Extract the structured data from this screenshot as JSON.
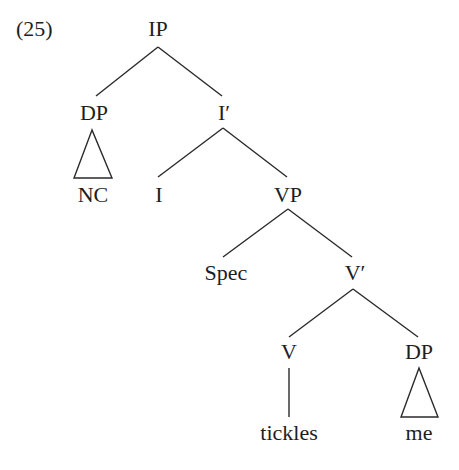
{
  "example_number": "(25)",
  "tree": {
    "nodes": {
      "ip": "IP",
      "dp_subject": "DP",
      "nc": "NC",
      "i_bar": "I′",
      "i": "I",
      "vp": "VP",
      "spec": "Spec",
      "v_bar": "V′",
      "v": "V",
      "tickles": "tickles",
      "dp_object": "DP",
      "me": "me"
    },
    "edges": [
      [
        "IP",
        "DP"
      ],
      [
        "IP",
        "I′"
      ],
      [
        "DP",
        "NC (triangle)"
      ],
      [
        "I′",
        "I"
      ],
      [
        "I′",
        "VP"
      ],
      [
        "VP",
        "Spec"
      ],
      [
        "VP",
        "V′"
      ],
      [
        "V′",
        "V"
      ],
      [
        "V′",
        "DP"
      ],
      [
        "V",
        "tickles"
      ],
      [
        "DP",
        "me (triangle)"
      ]
    ]
  },
  "colors": {
    "ink": "#1e1e1e",
    "background": "#ffffff"
  }
}
